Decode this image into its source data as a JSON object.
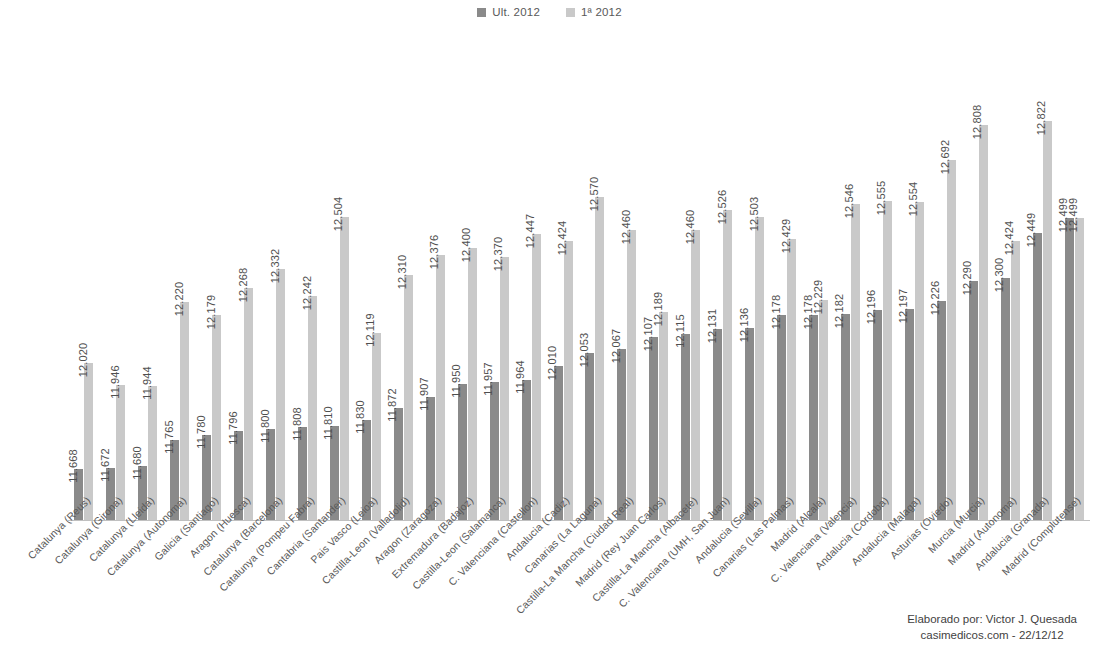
{
  "legend": {
    "items": [
      {
        "label": "Ult. 2012",
        "color": "#8a8a8a"
      },
      {
        "label": "1ª 2012",
        "color": "#c9c9c9"
      }
    ]
  },
  "credit": {
    "line1": "Elaborado por: Victor J. Quesada",
    "line2": "casimedicos.com - 22/12/12"
  },
  "chart_data": {
    "type": "bar",
    "title": "",
    "xlabel": "",
    "ylabel": "",
    "grid": false,
    "legend_position": "top-center",
    "ylim": [
      11.5,
      12.9
    ],
    "value_format": "#.###",
    "categories": [
      "Catalunya (Reus)",
      "Catalunya (Girona)",
      "Catalunya (Lleida)",
      "Catalunya (Autonoma)",
      "Galicia (Santiago)",
      "Aragon (Huesca)",
      "Catalunya (Barcelona)",
      "Catalunya (Pompeu Fabra)",
      "Cantabria (Santander)",
      "Pais Vasco (Leioa)",
      "Castilla-Leon (Valladolid)",
      "Aragon (Zaragoza)",
      "Extremadura (Badajoz)",
      "Castilla-Leon (Salamanca)",
      "C. Valenciana (Castellon)",
      "Andalucia (Cadiz)",
      "Canarias (La Laguna)",
      "Castilla-La Mancha (Ciudad Real)",
      "Madrid (Rey Juan Carlos)",
      "Castilla-La Mancha (Albacete)",
      "C. Valenciana (UMH, San Juan)",
      "Andalucia (Sevilla)",
      "Canarias (Las Palmas)",
      "Madrid (Alcala)",
      "C. Valenciana (Valencia)",
      "Andalucia (Cordoba)",
      "Andalucia (Malaga)",
      "Asturias (Oviedo)",
      "Murcia (Murcia)",
      "Madrid (Autonoma)",
      "Andalucia (Granada)",
      "Madrid (Complutense)"
    ],
    "series": [
      {
        "name": "Ult. 2012",
        "color": "#8a8a8a",
        "values": [
          11.668,
          11.672,
          11.68,
          11.765,
          11.78,
          11.796,
          11.8,
          11.808,
          11.81,
          11.83,
          11.872,
          11.907,
          11.95,
          11.957,
          11.964,
          12.01,
          12.053,
          12.067,
          12.107,
          12.115,
          12.131,
          12.136,
          12.178,
          12.178,
          12.182,
          12.196,
          12.197,
          12.226,
          12.29,
          12.3,
          12.449,
          12.499
        ],
        "labels": [
          "11.668",
          "11.672",
          "11.680",
          "11.765",
          "11.780",
          "11.796",
          "11.800",
          "11.808",
          "11.810",
          "11.830",
          "11.872",
          "11.907",
          "11.950",
          "11.957",
          "11.964",
          "12.010",
          "12.053",
          "12.067",
          "12.107",
          "12.115",
          "12.131",
          "12.136",
          "12.178",
          "12.178",
          "12.182",
          "12.196",
          "12.197",
          "12.226",
          "12.290",
          "12.300",
          "12.449",
          "12.499"
        ]
      },
      {
        "name": "1ª 2012",
        "color": "#c9c9c9",
        "values": [
          12.02,
          11.946,
          11.944,
          12.22,
          12.179,
          12.268,
          12.332,
          12.242,
          12.504,
          12.119,
          12.31,
          12.376,
          12.4,
          12.37,
          12.447,
          12.424,
          12.57,
          12.46,
          12.189,
          12.46,
          12.526,
          12.503,
          12.429,
          12.229,
          12.546,
          12.555,
          12.554,
          12.692,
          12.808,
          12.424,
          12.822,
          12.499
        ],
        "labels": [
          "12.020",
          "11.946",
          "11.944",
          "12.220",
          "12.179",
          "12.268",
          "12.332",
          "12.242",
          "12.504",
          "12.119",
          "12.310",
          "12.376",
          "12.400",
          "12.370",
          "12.447",
          "12.424",
          "12.570",
          "12.460",
          "12.189",
          "12.460",
          "12.526",
          "12.503",
          "12.429",
          "12.229",
          "12.546",
          "12.555",
          "12.554",
          "12.692",
          "12.808",
          "12.424",
          "12.822",
          "12.499"
        ]
      }
    ]
  }
}
